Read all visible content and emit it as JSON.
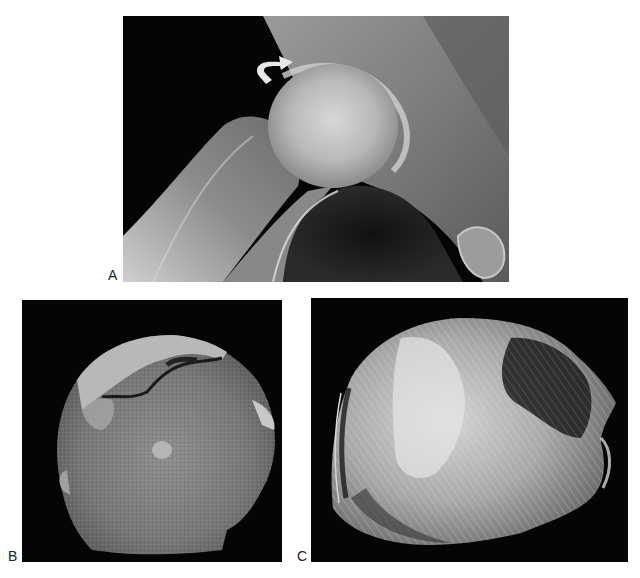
{
  "figure": {
    "panels": [
      {
        "id": "A",
        "label": "A",
        "description": "Radiograph of hip joint with curved arrow indicating subchondral collapse of femoral head"
      },
      {
        "id": "B",
        "label": "B",
        "description": "Gross cut section of femoral head specimen with separated articular cartilage and subchondral fracture"
      },
      {
        "id": "C",
        "label": "C",
        "description": "Radiograph of femoral head specimen slice showing trabecular pattern with dense and lucent zones"
      }
    ],
    "annotations": {
      "arrow": {
        "panel": "A",
        "type": "curved-arrow",
        "color": "#e8e8e8"
      }
    },
    "colors": {
      "background": "#ffffff",
      "panel_background": "#000000",
      "label_color": "#222222"
    }
  }
}
